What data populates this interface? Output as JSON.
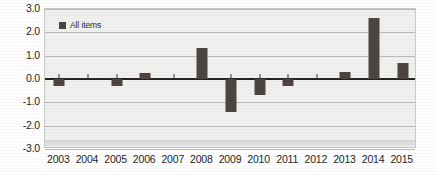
{
  "chart_data": {
    "type": "bar",
    "title": "",
    "subtitle": "",
    "xlabel": "",
    "ylabel": "",
    "categories": [
      "2003",
      "2004",
      "2005",
      "2006",
      "2007",
      "2008",
      "2009",
      "2010",
      "2011",
      "2012",
      "2013",
      "2014",
      "2015"
    ],
    "series": [
      {
        "name": "All items",
        "color": "#4a4340",
        "values": [
          -0.3,
          0.0,
          -0.3,
          0.25,
          0.0,
          1.35,
          -1.4,
          -0.7,
          -0.3,
          0.0,
          0.3,
          2.6,
          0.7
        ]
      }
    ],
    "ylim": [
      -3.0,
      3.0
    ],
    "ytick_labels": [
      "3.0",
      "2.0",
      "1.0",
      "0.0",
      "-1.0",
      "-2.0",
      "-3.0"
    ],
    "ytick_values": [
      3.0,
      2.0,
      1.0,
      0.0,
      -1.0,
      -2.0,
      -3.0
    ],
    "grid": true,
    "grid_axis": "y",
    "legend_position": "top-left-inside",
    "zero_line": true,
    "annotations": []
  },
  "legend": {
    "entries": [
      {
        "label": "All items",
        "color": "#4a4340"
      }
    ]
  },
  "colors": {
    "bar": "#4a4340",
    "plot_background": "#f0f0ef",
    "gridline": "#b9b9b7",
    "zero_line": "#23201e",
    "frame": "#c9c9c7",
    "text": "#1c1c1c"
  }
}
